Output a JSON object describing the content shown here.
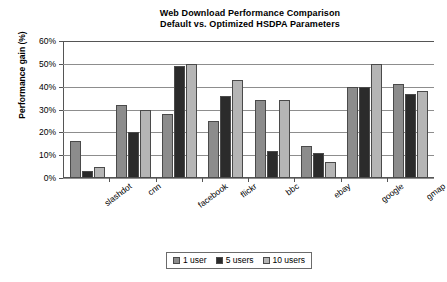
{
  "chart_data": {
    "type": "bar",
    "title": "Web Download Performance Comparison Default vs. Optimized HSDPA Parameters",
    "title_lines": [
      "Web Download Performance Comparison",
      "Default vs. Optimized HSDPA Parameters"
    ],
    "xlabel": "",
    "ylabel": "Performance gain (%)",
    "ylim": [
      0,
      60
    ],
    "ytick_values": [
      0,
      10,
      20,
      30,
      40,
      50,
      60
    ],
    "ytick_labels": [
      "0%",
      "10%",
      "20%",
      "30%",
      "40%",
      "50%",
      "60%"
    ],
    "grid": true,
    "legend_position": "bottom",
    "categories": [
      "slashdot",
      "cnn",
      "facebook",
      "flickr",
      "bbc",
      "ebay",
      "google",
      "gmap"
    ],
    "series": [
      {
        "name": "1 user",
        "color": "#8c8c8c",
        "values": [
          16,
          32,
          28,
          25,
          34,
          14,
          40,
          41
        ]
      },
      {
        "name": "5 users",
        "color": "#2b2b2b",
        "values": [
          3,
          20,
          49,
          36,
          12,
          11,
          40,
          37
        ]
      },
      {
        "name": "10 users",
        "color": "#b5b5b5",
        "values": [
          5,
          30,
          50,
          43,
          34,
          7,
          50,
          38
        ]
      }
    ]
  }
}
